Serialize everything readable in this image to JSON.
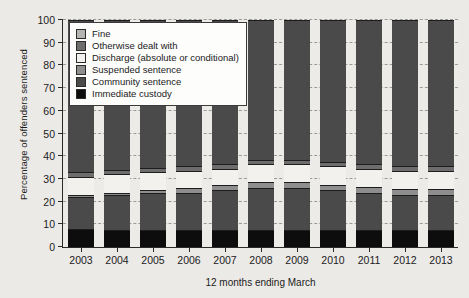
{
  "chart_data": {
    "type": "bar",
    "stacked": true,
    "title": "",
    "xlabel": "12 months ending March",
    "ylabel": "Percentage of offenders sentenced",
    "categories": [
      "2003",
      "2004",
      "2005",
      "2006",
      "2007",
      "2008",
      "2009",
      "2010",
      "2011",
      "2012",
      "2013"
    ],
    "ylim": [
      0,
      100
    ],
    "yticks": [
      0,
      10,
      20,
      30,
      40,
      50,
      60,
      70,
      80,
      90,
      100
    ],
    "grid": true,
    "legend_position": "upper left",
    "series": [
      {
        "name": "Immediate custody",
        "color": "#0d0d0d",
        "values": [
          8.0,
          7.5,
          7.5,
          7.5,
          7.5,
          7.5,
          7.5,
          7.5,
          7.5,
          7.5,
          7.5
        ]
      },
      {
        "name": "Community sentence",
        "color": "#4a4a4a",
        "values": [
          14.0,
          15.5,
          16.5,
          16.5,
          17.5,
          18.5,
          18.5,
          17.5,
          16.5,
          15.5,
          15.5
        ]
      },
      {
        "name": "Suspended sentence",
        "color": "#8e8e8e",
        "values": [
          1.0,
          1.0,
          1.0,
          2.0,
          2.5,
          2.5,
          2.5,
          2.5,
          2.5,
          2.5,
          2.5
        ]
      },
      {
        "name": "Discharge (absolute or conditional)",
        "color": "#f2f1ee",
        "values": [
          8.0,
          8.0,
          8.0,
          7.5,
          7.0,
          8.0,
          8.0,
          8.0,
          8.0,
          8.0,
          8.0
        ]
      },
      {
        "name": "Otherwise dealt with",
        "color": "#6d6d6d",
        "values": [
          2.0,
          2.0,
          2.0,
          2.0,
          2.0,
          2.0,
          2.0,
          2.0,
          2.0,
          2.0,
          2.0
        ]
      },
      {
        "name": "Fine",
        "color": "#4a4a4a",
        "values": [
          67.0,
          66.0,
          65.0,
          64.5,
          63.5,
          61.5,
          61.5,
          62.5,
          63.5,
          64.5,
          64.5
        ]
      }
    ],
    "legend_entries": [
      {
        "label": "Fine",
        "swatch": "#b4b4b2"
      },
      {
        "label": "Otherwise dealt with",
        "swatch": "#6d6d6d"
      },
      {
        "label": "Discharge (absolute or conditional)",
        "swatch": "#f2f1ee"
      },
      {
        "label": "Suspended sentence",
        "swatch": "#8e8e8e"
      },
      {
        "label": "Community sentence",
        "swatch": "#4a4a4a"
      },
      {
        "label": "Immediate custody",
        "swatch": "#0d0d0d"
      }
    ]
  }
}
